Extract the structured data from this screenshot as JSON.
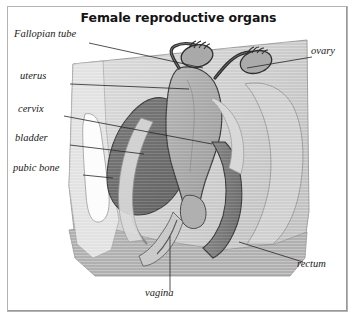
{
  "figure": {
    "title": "Female reproductive organs",
    "type": "anatomical-illustration",
    "view": "sagittal cross-section",
    "style": "grayscale halftone engraving"
  },
  "labels": [
    {
      "id": "fallopian-tube",
      "text": "Fallopian tube",
      "side": "left",
      "x": 14,
      "y": 28,
      "leader": {
        "x1": 82,
        "y1": 37,
        "x2": 196,
        "y2": 62
      }
    },
    {
      "id": "uterus",
      "text": "uterus",
      "side": "left",
      "x": 20,
      "y": 70,
      "leader": {
        "x1": 63,
        "y1": 78,
        "x2": 182,
        "y2": 83
      }
    },
    {
      "id": "cervix",
      "text": "cervix",
      "side": "left",
      "x": 18,
      "y": 103,
      "leader": {
        "x1": 57,
        "y1": 110,
        "x2": 205,
        "y2": 138
      }
    },
    {
      "id": "bladder",
      "text": "bladder",
      "side": "left",
      "x": 15,
      "y": 132,
      "leader": {
        "x1": 63,
        "y1": 139,
        "x2": 137,
        "y2": 148
      }
    },
    {
      "id": "pubic-bone",
      "text": "pubic bone",
      "side": "left",
      "x": 13,
      "y": 162,
      "leader": {
        "x1": 76,
        "y1": 169,
        "x2": 106,
        "y2": 172
      }
    },
    {
      "id": "ovary",
      "text": "ovary",
      "side": "right",
      "x": 310,
      "y": 45,
      "leader": {
        "x1": 305,
        "y1": 51,
        "x2": 240,
        "y2": 62
      }
    },
    {
      "id": "rectum",
      "text": "rectum",
      "side": "right",
      "x": 297,
      "y": 258,
      "leader": {
        "x1": 296,
        "y1": 256,
        "x2": 232,
        "y2": 236
      }
    },
    {
      "id": "vagina",
      "text": "vagina",
      "side": "below",
      "x": 145,
      "y": 287,
      "leader": {
        "x1": 163,
        "y1": 285,
        "x2": 163,
        "y2": 230
      }
    }
  ],
  "colors": {
    "background": "#ffffff",
    "frame": "#b3b3b3",
    "title": "#141414",
    "label": "#1a1a1a",
    "leader": "#2b2b2b",
    "tissue_light": "#d9d9d9",
    "tissue_mid": "#bdbdbd",
    "tissue_pale": "#e6e6e6",
    "uterus": "#a8a8a8",
    "bladder": "#6e6e6e",
    "rectum": "#7d7d7d",
    "bone": "#fbfbfb",
    "outline": "#4a4a4a",
    "dark_stroke": "#2a2a2a"
  }
}
